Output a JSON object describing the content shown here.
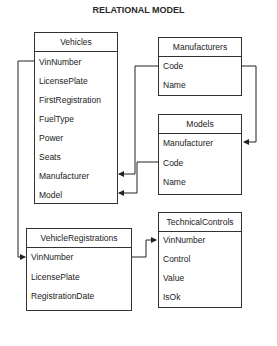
{
  "title": "RELATIONAL MODEL",
  "entities": {
    "vehicles": {
      "name": "Vehicles",
      "fields": [
        "VinNumber",
        "LicensePlate",
        "FirstRegistration",
        "FuelType",
        "Power",
        "Seats",
        "Manufacturer",
        "Model"
      ]
    },
    "manufacturers": {
      "name": "Manufacturers",
      "fields": [
        "Code",
        "Name"
      ]
    },
    "models": {
      "name": "Models",
      "fields": [
        "Manufacturer",
        "Code",
        "Name"
      ]
    },
    "vehicle_registrations": {
      "name": "VehicleRegistrations",
      "fields": [
        "VinNumber",
        "LicensePlate",
        "RegistrationDate"
      ]
    },
    "technical_controls": {
      "name": "TechnicalControls",
      "fields": [
        "VinNumber",
        "Control",
        "Value",
        "IsOk"
      ]
    }
  },
  "relations": [
    {
      "from": "Manufacturers.Code",
      "to": "Vehicles.Manufacturer"
    },
    {
      "from": "Manufacturers.Code",
      "to": "Models.Manufacturer"
    },
    {
      "from": "Models.Code",
      "to": "Vehicles.Model"
    },
    {
      "from": "Vehicles.VinNumber",
      "to": "VehicleRegistrations.VinNumber"
    },
    {
      "from": "VehicleRegistrations.VinNumber",
      "to": "TechnicalControls.VinNumber"
    }
  ]
}
